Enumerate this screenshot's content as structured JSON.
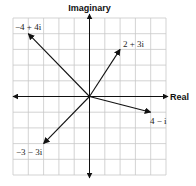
{
  "diagram": {
    "axes": {
      "x_label": "Real",
      "y_label": "Imaginary"
    },
    "grid": {
      "x_min": -5,
      "x_max": 5,
      "y_min": -5,
      "y_max": 5,
      "step": 1
    },
    "vectors": [
      {
        "label": "−4 + 4i",
        "re": -4,
        "im": 4
      },
      {
        "label": "2 + 3i",
        "re": 2,
        "im": 3
      },
      {
        "label": "4 − i",
        "re": 4,
        "im": -1
      },
      {
        "label": "−3 − 3i",
        "re": -3,
        "im": -3
      }
    ]
  }
}
